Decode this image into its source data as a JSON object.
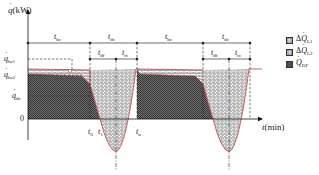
{
  "figure": {
    "type": "heat-load-defrost-cycle-diagram",
    "y_axis": {
      "label_symbol": "q",
      "label_unit": "(kW)"
    },
    "x_axis": {
      "label_symbol": "t",
      "label_unit": "(min)"
    },
    "y_ticks": [
      {
        "symbol": "q",
        "sub": "hc1"
      },
      {
        "symbol": "q",
        "sub": "hc2"
      },
      {
        "symbol": "q",
        "sub": "dc"
      },
      {
        "text": "0"
      }
    ],
    "x_ticks": [
      {
        "symbol": "t",
        "sub": "0"
      },
      {
        "symbol": "t",
        "sub": "1"
      },
      {
        "symbol": "t",
        "sub": "n"
      }
    ],
    "spans": [
      {
        "symbol": "t",
        "sub": "hc"
      },
      {
        "symbol": "t",
        "sub": "dc"
      },
      {
        "symbol": "t",
        "sub": "df"
      },
      {
        "symbol": "t",
        "sub": "rc"
      },
      {
        "symbol": "t",
        "sub": "hc"
      },
      {
        "symbol": "t",
        "sub": "dc"
      },
      {
        "symbol": "t",
        "sub": "df"
      },
      {
        "symbol": "t",
        "sub": "rc"
      }
    ],
    "legend": [
      {
        "prefix": "Δ",
        "symbol": "Q",
        "sub": "L1",
        "pattern": "brick"
      },
      {
        "prefix": "Δ",
        "symbol": "Q",
        "sub": "L2",
        "pattern": "hexagon"
      },
      {
        "prefix": "",
        "symbol": "Q",
        "sub": "DF",
        "pattern": "crosshatch-dark"
      }
    ],
    "colors": {
      "curve": "#c0504d",
      "dark_fill": "#555555",
      "axis": "#111111"
    }
  }
}
